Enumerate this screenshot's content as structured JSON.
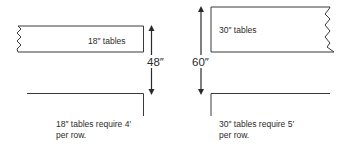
{
  "left_diagram": {
    "table_label": "18″ tables",
    "dimension_label": "48″",
    "caption_line1": "18″ tables require 4′",
    "caption_line2": "per row."
  },
  "right_diagram": {
    "table_label": "30″ tables",
    "dimension_label": "60″",
    "caption_line1": "30″ tables require 5′",
    "caption_line2": "per row."
  },
  "colors": {
    "line": "#3a3a3a",
    "background": "#ffffff"
  }
}
